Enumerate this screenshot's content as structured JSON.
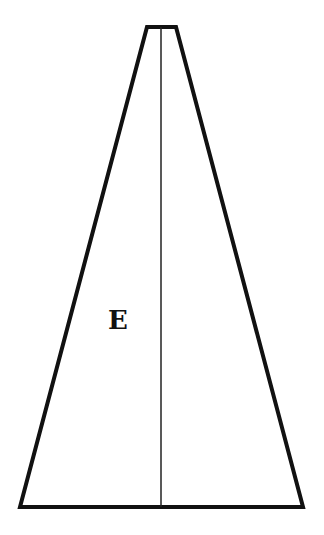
{
  "diagram": {
    "shape": "truncated-triangle",
    "stroke_color": "#111111",
    "background": "#ffffff",
    "outline": {
      "top_left": [
        147,
        27
      ],
      "top_right": [
        176,
        27
      ],
      "bottom_right": [
        303,
        507
      ],
      "bottom_left": [
        20,
        507
      ]
    },
    "center_line": {
      "x": 161,
      "y1": 27,
      "y2": 507
    },
    "label": {
      "text": "E",
      "x": 108,
      "y": 307
    }
  }
}
